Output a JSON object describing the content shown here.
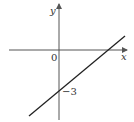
{
  "figure": {
    "type": "coordinate-graph",
    "axes": {
      "x_label": "x",
      "y_label": "y",
      "origin_label": "0"
    },
    "line": {
      "y_intercept": -3,
      "y_intercept_label": "−3",
      "slope_sign": "positive"
    },
    "colors": {
      "axis": "#555555",
      "line": "#222222",
      "text": "#333333"
    }
  }
}
